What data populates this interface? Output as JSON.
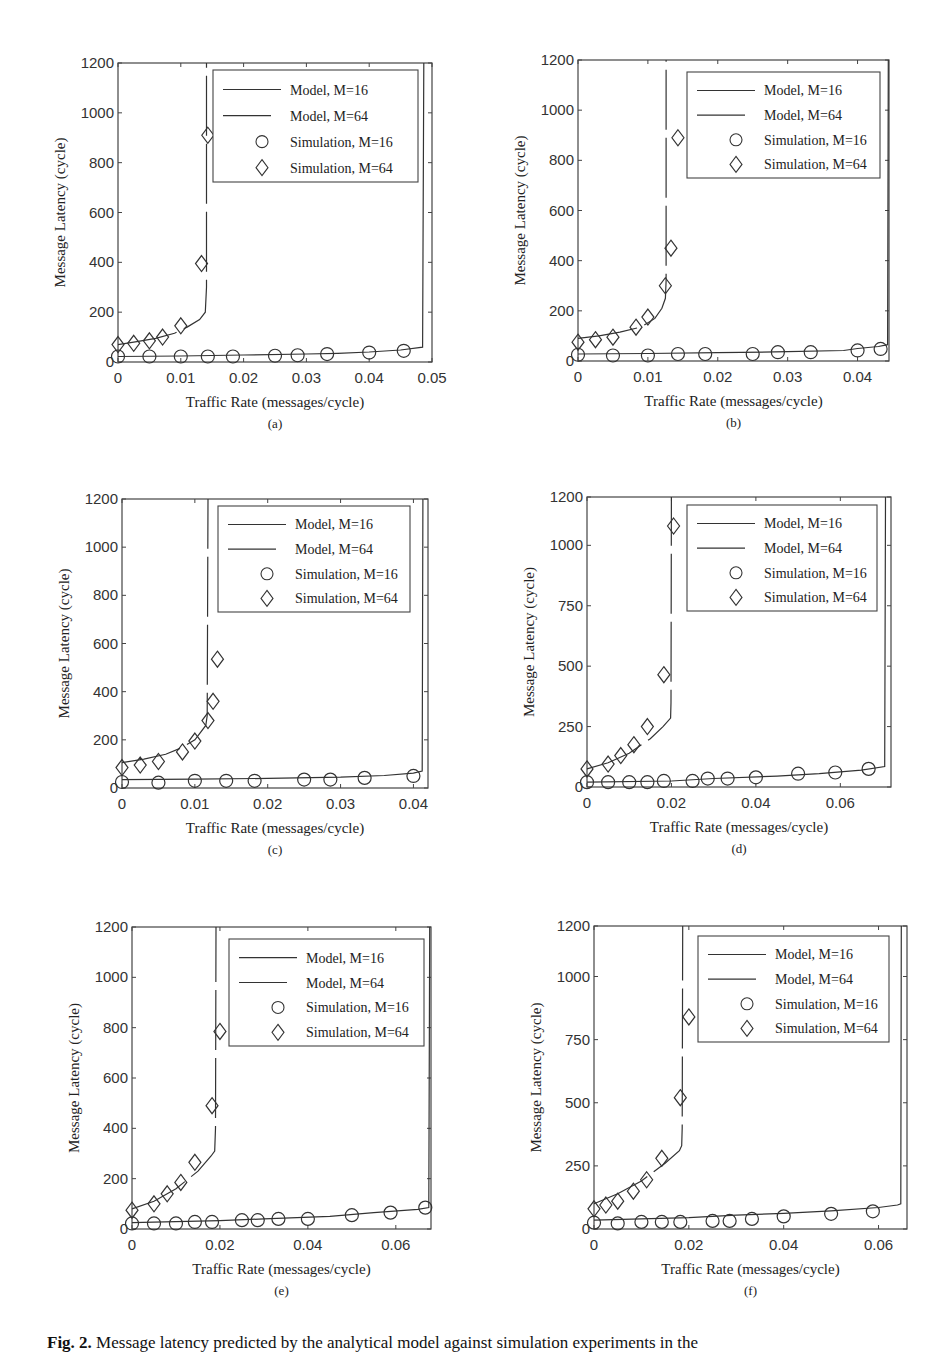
{
  "caption": {
    "label": "Fig. 2.",
    "text": "Message latency predicted by the analytical model against simulation experiments in the"
  },
  "legend": {
    "entries": [
      "Model, M=16",
      "Model, M=64",
      "Simulation, M=16",
      "Simulation, M=64"
    ]
  },
  "chart_data": [
    {
      "id": "a",
      "sublabel": "(a)",
      "type": "line",
      "xlabel": "Traffic Rate (messages/cycle)",
      "ylabel": "Message Latency (cycle)",
      "xlim": [
        0,
        0.05
      ],
      "ylim": [
        0,
        1200
      ],
      "xticks": [
        0,
        0.01,
        0.02,
        0.03,
        0.04,
        0.05
      ],
      "xtick_labels": [
        "0",
        "0.01",
        "0.02",
        "0.03",
        "0.04",
        "0.05"
      ],
      "yticks": [
        0,
        200,
        400,
        600,
        800,
        1000,
        1200
      ],
      "ytick_labels": [
        "0",
        "200",
        "400",
        "600",
        "800",
        "1000",
        "1200"
      ],
      "series": [
        {
          "name": "Model, M=16",
          "style": "solid",
          "x": [
            0,
            0.01,
            0.02,
            0.03,
            0.035,
            0.04,
            0.045,
            0.0485,
            0.0487
          ],
          "y": [
            22,
            24,
            28,
            32,
            35,
            40,
            48,
            60,
            1200
          ]
        },
        {
          "name": "Model, M=64",
          "style": "dashed",
          "x": [
            0,
            0.003,
            0.006,
            0.009,
            0.011,
            0.013,
            0.0139,
            0.0141,
            0.0141
          ],
          "y": [
            70,
            82,
            95,
            115,
            140,
            170,
            200,
            300,
            1200
          ]
        },
        {
          "name": "Simulation, M=16",
          "marker": "circle",
          "x": [
            0,
            0.005,
            0.01,
            0.0143,
            0.0183,
            0.025,
            0.0286,
            0.0333,
            0.04,
            0.0455
          ],
          "y": [
            22,
            22,
            22,
            22,
            22,
            25,
            27,
            32,
            38,
            45
          ]
        },
        {
          "name": "Simulation, M=64",
          "marker": "diamond",
          "x": [
            0,
            0.0025,
            0.005,
            0.0071,
            0.01,
            0.0133,
            0.0143
          ],
          "y": [
            70,
            75,
            85,
            100,
            145,
            395,
            910
          ]
        }
      ],
      "legend_position": "upper right",
      "grid": false
    },
    {
      "id": "b",
      "sublabel": "(b)",
      "type": "line",
      "xlabel": "Traffic Rate (messages/cycle)",
      "ylabel": "Message Latency (cycle)",
      "xlim": [
        0,
        0.0445
      ],
      "ylim": [
        0,
        1200
      ],
      "xticks": [
        0,
        0.01,
        0.02,
        0.03,
        0.04
      ],
      "xtick_labels": [
        "0",
        "0.01",
        "0.02",
        "0.03",
        "0.04"
      ],
      "yticks": [
        0,
        200,
        400,
        600,
        800,
        1000,
        1200
      ],
      "ytick_labels": [
        "0",
        "200",
        "400",
        "600",
        "800",
        "1000",
        "1200"
      ],
      "series": [
        {
          "name": "Model, M=16",
          "style": "solid",
          "x": [
            0,
            0.01,
            0.02,
            0.03,
            0.038,
            0.04,
            0.043,
            0.0443,
            0.0444
          ],
          "y": [
            28,
            30,
            33,
            37,
            42,
            50,
            58,
            65,
            1200
          ]
        },
        {
          "name": "Model, M=64",
          "style": "dashed",
          "x": [
            0,
            0.003,
            0.006,
            0.009,
            0.011,
            0.012,
            0.0125,
            0.0126,
            0.0126
          ],
          "y": [
            90,
            100,
            115,
            135,
            170,
            210,
            250,
            320,
            1200
          ]
        },
        {
          "name": "Simulation, M=16",
          "marker": "circle",
          "x": [
            0,
            0.005,
            0.01,
            0.0143,
            0.0182,
            0.025,
            0.0286,
            0.0333,
            0.04,
            0.0433
          ],
          "y": [
            25,
            22,
            22,
            28,
            28,
            28,
            35,
            35,
            42,
            48
          ]
        },
        {
          "name": "Simulation, M=64",
          "marker": "diamond",
          "x": [
            0,
            0.0025,
            0.005,
            0.0083,
            0.01,
            0.0125,
            0.0133,
            0.0143
          ],
          "y": [
            75,
            85,
            95,
            135,
            175,
            300,
            450,
            890
          ]
        }
      ],
      "legend_position": "upper right",
      "grid": false
    },
    {
      "id": "c",
      "sublabel": "(c)",
      "type": "line",
      "xlabel": "Traffic Rate (messages/cycle)",
      "ylabel": "Message Latency (cycle)",
      "xlim": [
        0,
        0.042
      ],
      "ylim": [
        0,
        1200
      ],
      "xticks": [
        0,
        0.01,
        0.02,
        0.03,
        0.04
      ],
      "xtick_labels": [
        "0",
        "0.01",
        "0.02",
        "0.03",
        "0.04"
      ],
      "yticks": [
        0,
        200,
        400,
        600,
        800,
        1000,
        1200
      ],
      "ytick_labels": [
        "0",
        "200",
        "400",
        "600",
        "800",
        "1000",
        "1200"
      ],
      "series": [
        {
          "name": "Model, M=16",
          "style": "solid",
          "x": [
            0,
            0.01,
            0.02,
            0.03,
            0.036,
            0.04,
            0.0412,
            0.0413
          ],
          "y": [
            35,
            37,
            40,
            45,
            52,
            62,
            70,
            1200
          ]
        },
        {
          "name": "Model, M=64",
          "style": "dashed",
          "x": [
            0,
            0.003,
            0.006,
            0.008,
            0.01,
            0.0115,
            0.0117,
            0.0118
          ],
          "y": [
            105,
            120,
            140,
            165,
            200,
            260,
            300,
            1200
          ]
        },
        {
          "name": "Simulation, M=16",
          "marker": "circle",
          "x": [
            0,
            0.005,
            0.01,
            0.0143,
            0.0182,
            0.025,
            0.0286,
            0.0333,
            0.04
          ],
          "y": [
            25,
            22,
            30,
            30,
            30,
            35,
            35,
            42,
            50
          ]
        },
        {
          "name": "Simulation, M=64",
          "marker": "diamond",
          "x": [
            0,
            0.0025,
            0.005,
            0.0083,
            0.01,
            0.0118,
            0.0125,
            0.0131
          ],
          "y": [
            85,
            95,
            110,
            150,
            195,
            280,
            360,
            535
          ]
        }
      ],
      "legend_position": "upper right",
      "grid": false
    },
    {
      "id": "d",
      "sublabel": "(d)",
      "type": "line",
      "xlabel": "Traffic Rate (messages/cycle)",
      "ylabel": "Message Latency (cycle)",
      "xlim": [
        0,
        0.072
      ],
      "ylim": [
        0,
        1200
      ],
      "xticks": [
        0,
        0.02,
        0.04,
        0.06
      ],
      "xtick_labels": [
        "0",
        "0.02",
        "0.04",
        "0.06"
      ],
      "yticks": [
        0,
        250,
        500,
        750,
        1000,
        1200
      ],
      "ytick_labels": [
        "0",
        "250",
        "500",
        "750",
        "1000",
        "1200"
      ],
      "series": [
        {
          "name": "Model, M=16",
          "style": "solid",
          "x": [
            0,
            0.02,
            0.03,
            0.045,
            0.055,
            0.065,
            0.0705,
            0.0707
          ],
          "y": [
            20,
            25,
            35,
            45,
            55,
            70,
            85,
            1200
          ]
        },
        {
          "name": "Model, M=64",
          "style": "dashed",
          "x": [
            0,
            0.005,
            0.01,
            0.015,
            0.018,
            0.0198,
            0.0199,
            0.02
          ],
          "y": [
            75,
            100,
            140,
            200,
            250,
            285,
            350,
            1200
          ]
        },
        {
          "name": "Simulation, M=16",
          "marker": "circle",
          "x": [
            0,
            0.005,
            0.01,
            0.0143,
            0.0182,
            0.025,
            0.0286,
            0.0333,
            0.04,
            0.05,
            0.0588,
            0.0667
          ],
          "y": [
            20,
            20,
            20,
            20,
            25,
            25,
            35,
            35,
            40,
            55,
            60,
            75
          ]
        },
        {
          "name": "Simulation, M=64",
          "marker": "diamond",
          "x": [
            0,
            0.005,
            0.008,
            0.0111,
            0.0143,
            0.0182,
            0.0205
          ],
          "y": [
            75,
            95,
            130,
            175,
            250,
            465,
            1080
          ]
        }
      ],
      "legend_position": "upper right",
      "grid": false
    },
    {
      "id": "e",
      "sublabel": "(e)",
      "type": "line",
      "xlabel": "Traffic Rate (messages/cycle)",
      "ylabel": "Message Latency (cycle)",
      "xlim": [
        0,
        0.068
      ],
      "ylim": [
        0,
        1200
      ],
      "xticks": [
        0,
        0.02,
        0.04,
        0.06
      ],
      "xtick_labels": [
        "0",
        "0.02",
        "0.04",
        "0.06"
      ],
      "yticks": [
        0,
        200,
        400,
        600,
        800,
        1000,
        1200
      ],
      "ytick_labels": [
        "0",
        "200",
        "400",
        "600",
        "800",
        "1000",
        "1200"
      ],
      "series": [
        {
          "name": "Model, M=16",
          "style": "solid",
          "x": [
            0,
            0.02,
            0.03,
            0.045,
            0.055,
            0.065,
            0.0675,
            0.0677
          ],
          "y": [
            25,
            33,
            40,
            50,
            65,
            78,
            85,
            1200
          ]
        },
        {
          "name": "Model, M=64",
          "style": "dashed",
          "x": [
            0,
            0.005,
            0.01,
            0.015,
            0.018,
            0.0188,
            0.019,
            0.0191
          ],
          "y": [
            80,
            110,
            160,
            230,
            290,
            310,
            400,
            1200
          ]
        },
        {
          "name": "Simulation, M=16",
          "marker": "circle",
          "x": [
            0,
            0.005,
            0.01,
            0.0143,
            0.0182,
            0.025,
            0.0286,
            0.0333,
            0.04,
            0.05,
            0.0588,
            0.0667
          ],
          "y": [
            22,
            22,
            22,
            28,
            28,
            35,
            35,
            40,
            40,
            55,
            65,
            85
          ]
        },
        {
          "name": "Simulation, M=64",
          "marker": "diamond",
          "x": [
            0,
            0.005,
            0.008,
            0.0111,
            0.0143,
            0.0182,
            0.02
          ],
          "y": [
            75,
            100,
            140,
            185,
            265,
            490,
            785
          ]
        }
      ],
      "legend_position": "upper right",
      "grid": false
    },
    {
      "id": "f",
      "sublabel": "(f)",
      "type": "line",
      "xlabel": "Traffic Rate (messages/cycle)",
      "ylabel": "Message Latency (cycle)",
      "xlim": [
        0,
        0.066
      ],
      "ylim": [
        0,
        1200
      ],
      "xticks": [
        0,
        0.02,
        0.04,
        0.06
      ],
      "xtick_labels": [
        "0",
        "0.02",
        "0.04",
        "0.06"
      ],
      "yticks": [
        0,
        250,
        500,
        750,
        1000,
        1200
      ],
      "ytick_labels": [
        "0",
        "250",
        "500",
        "750",
        "1000",
        "1200"
      ],
      "series": [
        {
          "name": "Model, M=16",
          "style": "solid",
          "x": [
            0,
            0.02,
            0.03,
            0.04,
            0.05,
            0.06,
            0.064,
            0.0647,
            0.0648
          ],
          "y": [
            35,
            45,
            55,
            62,
            72,
            85,
            95,
            100,
            1200
          ]
        },
        {
          "name": "Model, M=64",
          "style": "dashed",
          "x": [
            0,
            0.005,
            0.01,
            0.015,
            0.018,
            0.0185,
            0.0186,
            0.0187
          ],
          "y": [
            100,
            140,
            190,
            260,
            310,
            330,
            400,
            1200
          ]
        },
        {
          "name": "Simulation, M=16",
          "marker": "circle",
          "x": [
            0,
            0.005,
            0.01,
            0.0143,
            0.0182,
            0.025,
            0.0286,
            0.0333,
            0.04,
            0.05,
            0.0588
          ],
          "y": [
            25,
            22,
            28,
            28,
            28,
            32,
            32,
            40,
            50,
            60,
            70
          ]
        },
        {
          "name": "Simulation, M=64",
          "marker": "diamond",
          "x": [
            0,
            0.0025,
            0.005,
            0.0083,
            0.0111,
            0.0143,
            0.0182,
            0.02
          ],
          "y": [
            80,
            95,
            110,
            150,
            195,
            280,
            520,
            840
          ]
        }
      ],
      "legend_position": "upper right",
      "grid": false
    }
  ]
}
